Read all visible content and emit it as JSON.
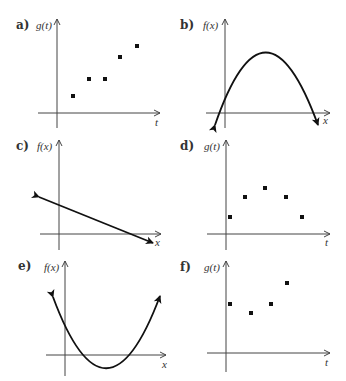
{
  "panels": [
    {
      "id": "a",
      "label": "a)",
      "ylabel": "g(t)",
      "xlabel": "t",
      "kind": "scatter"
    },
    {
      "id": "b",
      "label": "b)",
      "ylabel": "f(x)",
      "xlabel": "x",
      "kind": "parabola-down"
    },
    {
      "id": "c",
      "label": "c)",
      "ylabel": "f(x)",
      "xlabel": "x",
      "kind": "line"
    },
    {
      "id": "d",
      "label": "d)",
      "ylabel": "g(t)",
      "xlabel": "t",
      "kind": "scatter"
    },
    {
      "id": "e",
      "label": "e)",
      "ylabel": "f(x)",
      "xlabel": "x",
      "kind": "parabola-up"
    },
    {
      "id": "f",
      "label": "f)",
      "ylabel": "g(t)",
      "xlabel": "t",
      "kind": "scatter"
    }
  ],
  "colors": {
    "ink": "#111111",
    "axis": "#444444",
    "text": "#333333",
    "background": "#ffffff"
  }
}
